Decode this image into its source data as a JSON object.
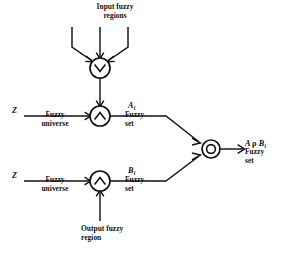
{
  "diagram": {
    "stroke_color": "#111111",
    "background_color": "#ffffff",
    "labels": {
      "input_fuzzy_regions": "Input fuzzy\nregions",
      "output_fuzzy_region": "Output fuzzy\nregion",
      "universe_symbol_top": "Z",
      "universe_symbol_bottom": "Z",
      "fuzzy_universe_top": "Fuzzy\nuniverse",
      "fuzzy_universe_bottom": "Fuzzy\nuniverse",
      "fuzzy_set_top": "Fuzzy\nset",
      "fuzzy_set_bottom": "Fuzzy\nset",
      "fuzzy_set_result": "Fuzzy\nset",
      "signal_a": "A",
      "signal_a_subscript": "i",
      "signal_b": "B",
      "signal_b_subscript": "i",
      "result_left_operand": "A",
      "result_operator": "ρ",
      "result_right_operand": "B",
      "result_subscript": "i"
    },
    "nodes": [
      {
        "id": "or-node",
        "operator": "∨",
        "operator_name": "disjunction-max",
        "style": "single-circle",
        "cx": 100,
        "cy": 68,
        "r": 10
      },
      {
        "id": "and-node-top",
        "operator": "∧",
        "operator_name": "conjunction-min",
        "style": "single-circle",
        "cx": 100,
        "cy": 116,
        "r": 10
      },
      {
        "id": "and-node-bottom",
        "operator": "∧",
        "operator_name": "conjunction-min",
        "style": "single-circle",
        "cx": 100,
        "cy": 181,
        "r": 10
      },
      {
        "id": "compose-node",
        "operator": "○",
        "operator_name": "composition",
        "style": "double-circle",
        "cx": 211,
        "cy": 149,
        "r": 9,
        "r_inner": 4.4
      }
    ],
    "input_stems": [
      {
        "id": "stem-left",
        "x": 72,
        "bend": true,
        "direction": "right"
      },
      {
        "id": "stem-center",
        "x": 100,
        "bend": false,
        "direction": "down"
      },
      {
        "id": "stem-right",
        "x": 128,
        "bend": true,
        "direction": "left"
      }
    ]
  }
}
